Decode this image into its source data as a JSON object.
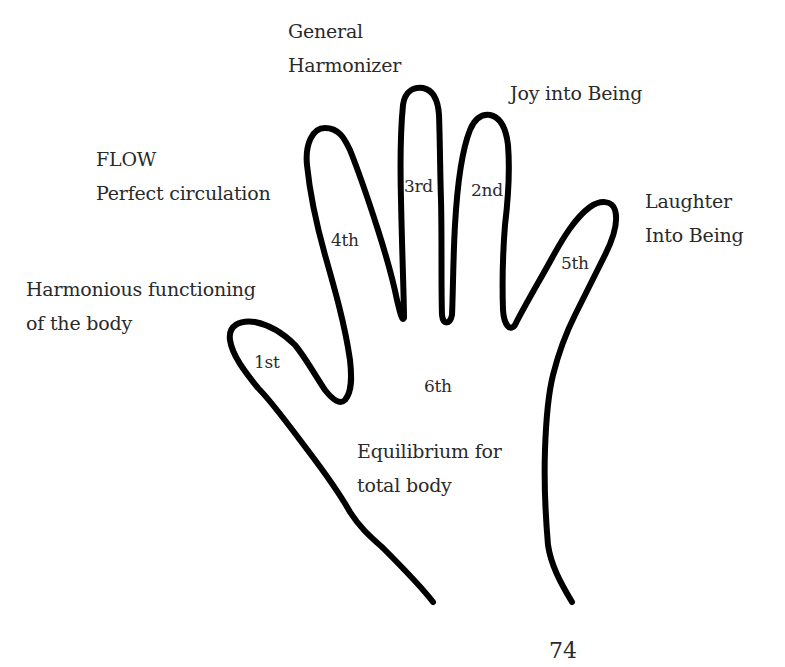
{
  "diagram": {
    "type": "hand-finger-map",
    "stroke_color": "#000000",
    "text_color": "#2a2a2a",
    "background": "#ffffff",
    "fingers": [
      {
        "id": "1st",
        "label": "1st",
        "description_lines": [
          "Harmonious functioning",
          "of the body"
        ]
      },
      {
        "id": "2nd",
        "label": "2nd",
        "description_lines": [
          "Joy into Being"
        ]
      },
      {
        "id": "3rd",
        "label": "3rd",
        "description_lines": [
          "General",
          "Harmonizer"
        ]
      },
      {
        "id": "4th",
        "label": "4th",
        "description_lines": [
          "FLOW",
          "Perfect circulation"
        ]
      },
      {
        "id": "5th",
        "label": "5th",
        "description_lines": [
          "Laughter",
          "Into Being"
        ]
      },
      {
        "id": "6th",
        "label": "6th",
        "description_lines": [
          "Equilibrium for",
          "total body"
        ]
      }
    ]
  },
  "page_number": "74"
}
